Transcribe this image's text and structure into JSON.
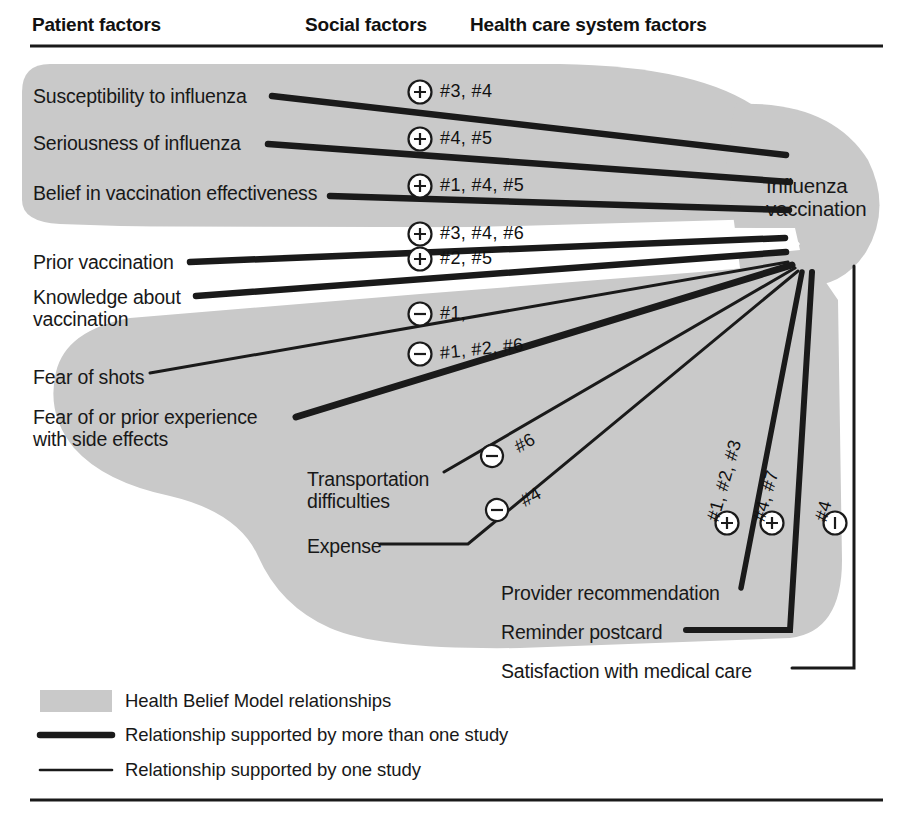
{
  "figure": {
    "width": 909,
    "height": 825,
    "colors": {
      "shade": "#c9c9c9",
      "line": "#1a1a1a",
      "background": "#ffffff",
      "text": "#1a1a1a"
    }
  },
  "columns": [
    {
      "id": "patient",
      "label": "Patient factors",
      "x": 32
    },
    {
      "id": "social",
      "label": "Social factors",
      "x": 305
    },
    {
      "id": "system",
      "label": "Health care system factors",
      "x": 470
    }
  ],
  "target": {
    "line1": "Influenza",
    "line2": "vaccination"
  },
  "nodes": [
    {
      "id": "susceptibility",
      "label": "Susceptibility to influenza",
      "column": "patient",
      "x": 33,
      "y": 86
    },
    {
      "id": "seriousness",
      "label": "Seriousness of influenza",
      "column": "patient",
      "x": 33,
      "y": 133
    },
    {
      "id": "belief",
      "label": "Belief in vaccination effectiveness",
      "column": "patient",
      "x": 33,
      "y": 183
    },
    {
      "id": "prior-vaccination",
      "label": "Prior vaccination",
      "column": "patient",
      "x": 33,
      "y": 252
    },
    {
      "id": "knowledge",
      "label": "Knowledge about vaccination",
      "column": "patient",
      "x": 33,
      "y": 287,
      "lines": [
        "Knowledge about",
        "vaccination"
      ]
    },
    {
      "id": "fear-shots",
      "label": "Fear of shots",
      "column": "patient",
      "x": 33,
      "y": 367
    },
    {
      "id": "fear-side-effects",
      "label": "Fear of or prior experience with side effects",
      "column": "patient",
      "x": 33,
      "y": 407,
      "lines": [
        "Fear of or prior experience",
        "with side effects"
      ]
    },
    {
      "id": "transportation",
      "label": "Transportation difficulties",
      "column": "social",
      "x": 307,
      "y": 469,
      "lines": [
        "Transportation",
        "difficulties"
      ]
    },
    {
      "id": "expense",
      "label": "Expense",
      "column": "social",
      "x": 307,
      "y": 536
    },
    {
      "id": "provider-recommendation",
      "label": "Provider recommendation",
      "column": "system",
      "x": 501,
      "y": 583
    },
    {
      "id": "reminder-postcard",
      "label": "Reminder postcard",
      "column": "system",
      "x": 501,
      "y": 622
    },
    {
      "id": "satisfaction",
      "label": "Satisfaction with medical care",
      "column": "system",
      "x": 501,
      "y": 661
    }
  ],
  "relationships": [
    {
      "from": "susceptibility",
      "to": "influenza-vaccination",
      "sign": "+",
      "studies": "#3, #4",
      "weight": "thick",
      "label_x": 434,
      "label_y": 86
    },
    {
      "from": "seriousness",
      "to": "influenza-vaccination",
      "sign": "+",
      "studies": "#4, #5",
      "weight": "thick",
      "label_x": 434,
      "label_y": 133
    },
    {
      "from": "belief",
      "to": "influenza-vaccination",
      "sign": "+",
      "studies": "#1, #4, #5",
      "weight": "thick",
      "label_x": 434,
      "label_y": 180
    },
    {
      "from": "prior-vaccination",
      "to": "influenza-vaccination",
      "sign": "+",
      "studies": "#3, #4, #6",
      "weight": "thick",
      "label_x": 434,
      "label_y": 228
    },
    {
      "from": "knowledge",
      "to": "influenza-vaccination",
      "sign": "+",
      "studies": "#2, #5",
      "weight": "thick",
      "label_x": 434,
      "label_y": 253
    },
    {
      "from": "fear-shots",
      "to": "influenza-vaccination",
      "sign": "-",
      "studies": "#1,",
      "weight": "thin",
      "label_x": 434,
      "label_y": 308
    },
    {
      "from": "fear-side-effects",
      "to": "influenza-vaccination",
      "sign": "-",
      "studies": "#1, #2, #6",
      "weight": "thick",
      "label_x": 434,
      "label_y": 348
    },
    {
      "from": "transportation",
      "to": "influenza-vaccination",
      "sign": "-",
      "studies": "#6",
      "weight": "thin",
      "label_x": 495,
      "label_y": 428
    },
    {
      "from": "expense",
      "to": "influenza-vaccination",
      "sign": "-",
      "studies": "#4",
      "weight": "thin",
      "label_x": 495,
      "label_y": 481
    },
    {
      "from": "provider-recommendation",
      "to": "influenza-vaccination",
      "sign": "+",
      "studies": "#1, #2, #3",
      "weight": "thick",
      "label_x": 733,
      "label_y": 508,
      "rotated": true
    },
    {
      "from": "reminder-postcard",
      "to": "influenza-vaccination",
      "sign": "+",
      "studies": "#4, #7",
      "weight": "thick",
      "label_x": 781,
      "label_y": 508,
      "rotated": true
    },
    {
      "from": "satisfaction",
      "to": "influenza-vaccination",
      "sign": "-",
      "studies": "#4",
      "weight": "thin",
      "label_x": 841,
      "label_y": 508,
      "rotated": true
    }
  ],
  "legend": {
    "items": [
      {
        "id": "hbm-shade",
        "swatch": "shade",
        "label": "Health Belief Model relationships"
      },
      {
        "id": "multi-study",
        "swatch": "thick-line",
        "label": "Relationship supported by more than one study"
      },
      {
        "id": "single-study",
        "swatch": "thin-line",
        "label": "Relationship supported by one study"
      }
    ]
  },
  "symbols": {
    "positive": "+",
    "negative": "–"
  }
}
